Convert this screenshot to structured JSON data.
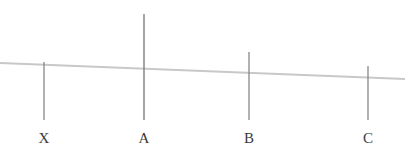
{
  "canvas": {
    "width": 405,
    "height": 153,
    "background": "#ffffff"
  },
  "colors": {
    "baseline": "#c8c8c8",
    "tick": "#7e7e7e",
    "label_text": "#3a3a3a"
  },
  "baseline": {
    "name": "baseline",
    "x1": 0,
    "y1": 63,
    "x2": 405,
    "y2": 79,
    "stroke_width": 2.2,
    "color": "#c8c8c8"
  },
  "ticks": [
    {
      "id": "x",
      "label": "X",
      "x": 44,
      "top_y": 62,
      "bottom_y": 120,
      "stroke_width": 1.2,
      "label_x": 44,
      "label_y": 131
    },
    {
      "id": "a",
      "label": "A",
      "x": 144,
      "top_y": 14,
      "bottom_y": 120,
      "stroke_width": 1.4,
      "label_x": 144,
      "label_y": 131
    },
    {
      "id": "b",
      "label": "B",
      "x": 249,
      "top_y": 52,
      "bottom_y": 120,
      "stroke_width": 1.2,
      "label_x": 249,
      "label_y": 131
    },
    {
      "id": "c",
      "label": "C",
      "x": 368,
      "top_y": 66,
      "bottom_y": 120,
      "stroke_width": 1.2,
      "label_x": 368,
      "label_y": 131
    }
  ],
  "chart_data": {
    "type": "line",
    "title": "",
    "xlabel": "",
    "ylabel": "",
    "categories": [
      "X",
      "A",
      "B",
      "C"
    ],
    "x": [
      44,
      144,
      249,
      368
    ],
    "series": [
      {
        "name": "tick-height",
        "values": [
          58,
          106,
          68,
          54
        ]
      }
    ],
    "annotations": [
      "Near-horizontal gray baseline sloping slightly downward from left to right",
      "Four vertical gray tick marks of differing heights labelled X, A, B, C"
    ],
    "grid": false,
    "legend": "none"
  }
}
